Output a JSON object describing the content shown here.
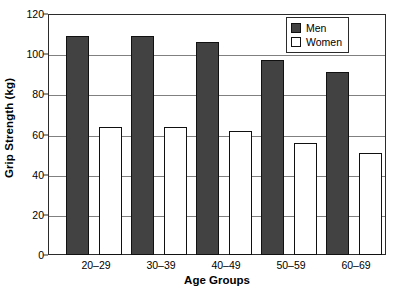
{
  "chart_data": {
    "type": "bar",
    "title": "",
    "xlabel": "Age Groups",
    "ylabel": "Grip Strength (kg)",
    "categories": [
      "20–29",
      "30–39",
      "40–49",
      "50–59",
      "60–69"
    ],
    "series": [
      {
        "name": "Men",
        "color": "#424242",
        "values": [
          109,
          109,
          106,
          97,
          91
        ]
      },
      {
        "name": "Women",
        "color": "#ffffff",
        "values": [
          64,
          64,
          62,
          56,
          51
        ]
      }
    ],
    "ylim": [
      0,
      120
    ],
    "ytick_step": 20,
    "yticks": [
      0,
      20,
      40,
      60,
      80,
      100,
      120
    ],
    "ytick_labels": [
      "0",
      "20",
      "40",
      "60",
      "80",
      "100",
      "120"
    ],
    "grid": true,
    "grid_axis": "y",
    "legend_position": "top-right",
    "legend_entries": [
      "Men",
      "Women"
    ]
  }
}
